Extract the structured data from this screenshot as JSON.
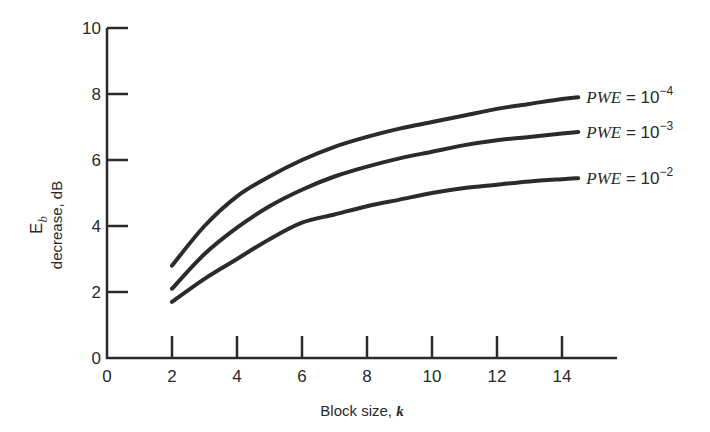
{
  "chart_data": {
    "type": "line",
    "title": "",
    "xlabel": "Block size, k",
    "ylabel_line1": "E_b",
    "ylabel_line2": "decrease, dB",
    "xlim": [
      0,
      15.5
    ],
    "ylim": [
      0,
      10
    ],
    "x_ticks": [
      "0",
      "2",
      "4",
      "6",
      "8",
      "10",
      "12",
      "14"
    ],
    "y_ticks": [
      "0",
      "2",
      "4",
      "6",
      "8",
      "10"
    ],
    "grid": false,
    "legend_position": "inline-right",
    "x": [
      2,
      3,
      4,
      5,
      6,
      7,
      8,
      9,
      10,
      11,
      12,
      13,
      14,
      14.5
    ],
    "series": [
      {
        "name": "PWE = 10^-4",
        "label_main": "PWE",
        "label_eq": " = 10",
        "label_exp": "−4",
        "values": [
          2.8,
          4.0,
          4.9,
          5.5,
          6.0,
          6.4,
          6.7,
          6.95,
          7.15,
          7.35,
          7.55,
          7.7,
          7.85,
          7.9
        ]
      },
      {
        "name": "PWE = 10^-3",
        "label_main": "PWE",
        "label_eq": " = 10",
        "label_exp": "−3",
        "values": [
          2.1,
          3.15,
          3.95,
          4.6,
          5.1,
          5.5,
          5.8,
          6.05,
          6.25,
          6.45,
          6.6,
          6.7,
          6.8,
          6.85
        ]
      },
      {
        "name": "PWE = 10^-2",
        "label_main": "PWE",
        "label_eq": " = 10",
        "label_exp": "−2",
        "values": [
          1.7,
          2.4,
          3.0,
          3.6,
          4.1,
          4.35,
          4.6,
          4.8,
          5.0,
          5.15,
          5.25,
          5.35,
          5.42,
          5.45
        ]
      }
    ]
  }
}
